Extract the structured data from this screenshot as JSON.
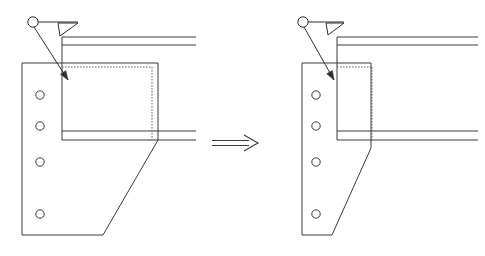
{
  "figure": {
    "background_color": "#ffffff",
    "line_color": "#3a3a3a",
    "dashed_line_color": "#555555",
    "width": 485,
    "height": 256
  },
  "transform_arrow": {
    "name": "implies-arrow",
    "glyph": "double-line-arrow-right",
    "x1": 212,
    "y1": 143,
    "x2": 258,
    "y2": 143
  },
  "details": [
    {
      "id": "left",
      "label": "original-detail",
      "weld_symbol": {
        "circle": {
          "cx": 33,
          "cy": 22,
          "r": 5.2
        },
        "reference_line": {
          "x1": 38,
          "y1": 22,
          "x2": 78,
          "y2": 22
        },
        "fillet_triangle": {
          "p1x": 58,
          "p1y": 23,
          "p2x": 78,
          "p2y": 23,
          "p3x": 60,
          "p3y": 36
        },
        "leader": {
          "x1": 34,
          "y1": 27,
          "x2": 68,
          "y2": 80
        },
        "arrow_tip": {
          "x": 68,
          "y": 80
        }
      },
      "plate": {
        "left": 22,
        "top": 63,
        "right": 103,
        "bottom": 235,
        "notch_x": 158,
        "notch_y": 140,
        "diagonal_from": {
          "x": 158,
          "y": 140
        },
        "diagonal_to": {
          "x": 103,
          "y": 235
        },
        "top_right_x": 158
      },
      "holes": [
        {
          "cx": 40,
          "cy": 95,
          "r": 4.2
        },
        {
          "cx": 40,
          "cy": 126,
          "r": 4.2
        },
        {
          "cx": 40,
          "cy": 162,
          "r": 4.2
        },
        {
          "cx": 40,
          "cy": 214,
          "r": 4.2
        }
      ],
      "beam": {
        "web_x": 62,
        "top_flange": {
          "y_top": 37,
          "y_bot": 45,
          "x_left": 62,
          "x_right": 196
        },
        "bottom_flange": {
          "y_top": 131,
          "y_bot": 140,
          "x_left": 62,
          "x_right": 196
        },
        "web_top_y": 37,
        "web_bottom_y": 140
      },
      "hidden_box": {
        "left": 62,
        "top": 67,
        "right": 152,
        "bottom": 140
      }
    },
    {
      "id": "right",
      "label": "revised-detail",
      "weld_symbol": {
        "circle": {
          "cx": 303,
          "cy": 22,
          "r": 5.2
        },
        "reference_line": {
          "x1": 308,
          "y1": 22,
          "x2": 344,
          "y2": 22
        },
        "fillet_triangle": {
          "p1x": 326,
          "p1y": 23,
          "p2x": 344,
          "p2y": 23,
          "p3x": 328,
          "p3y": 35
        },
        "leader": {
          "x1": 304,
          "y1": 27,
          "x2": 334,
          "y2": 80
        },
        "arrow_tip": {
          "x": 334,
          "y": 80
        }
      },
      "plate": {
        "left": 302,
        "top": 63,
        "right": 332,
        "bottom": 235,
        "notch_x": 371,
        "notch_y": 148,
        "diagonal_from": {
          "x": 371,
          "y": 148
        },
        "diagonal_to": {
          "x": 332,
          "y": 235
        },
        "top_right_x": 371
      },
      "holes": [
        {
          "cx": 316,
          "cy": 95,
          "r": 4.2
        },
        {
          "cx": 316,
          "cy": 126,
          "r": 4.2
        },
        {
          "cx": 316,
          "cy": 162,
          "r": 4.2
        },
        {
          "cx": 316,
          "cy": 214,
          "r": 4.2
        }
      ],
      "beam": {
        "web_x": 337,
        "top_flange": {
          "y_top": 37,
          "y_bot": 45,
          "x_left": 337,
          "x_right": 478
        },
        "bottom_flange": {
          "y_top": 131,
          "y_bot": 140,
          "x_left": 337,
          "x_right": 478
        },
        "web_top_y": 37,
        "web_bottom_y": 140
      },
      "hidden_box": {
        "left": 337,
        "top": 67,
        "right": 372,
        "bottom": 140
      }
    }
  ]
}
